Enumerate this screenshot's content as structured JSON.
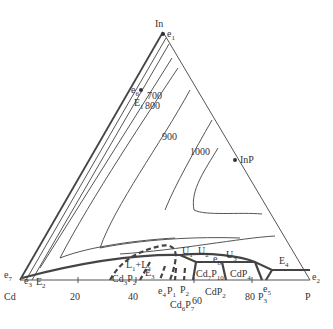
{
  "diagram": {
    "type": "ternary phase diagram (liquidus projection)",
    "vertices": {
      "top": "In",
      "left": "Cd",
      "right": "P"
    },
    "bottom_axis_ticks": [
      "20",
      "40",
      "60",
      "80"
    ],
    "isotherms": [
      "700",
      "800",
      "900",
      "1000"
    ],
    "compounds": [
      "InP",
      "Cd3P2",
      "Cd6P7",
      "Cd7P10",
      "CdP2",
      "CdP4"
    ],
    "invariant_points": [
      "e1",
      "e2",
      "e3",
      "e4",
      "e5",
      "e6",
      "e7",
      "e8",
      "E1",
      "E2",
      "E3",
      "E4",
      "U1",
      "U2",
      "U3"
    ],
    "region_labels": [
      "L1+L2"
    ],
    "phase_markers": [
      "P1",
      "P2",
      "P3"
    ],
    "labels": {
      "In": "In",
      "Cd": "Cd",
      "P": "P",
      "InP": "InP",
      "t20": "20",
      "t40": "40",
      "t60": "60",
      "t80": "80",
      "i700": "700",
      "i800": "800",
      "i900": "900",
      "i1000": "1000",
      "e": "e",
      "E": "E",
      "U": "U",
      "Pp": "P",
      "L": "L",
      "plus": "+",
      "s1": "1",
      "s2": "2",
      "s3": "3",
      "s4": "4",
      "s5": "5",
      "s6": "6",
      "s7": "7",
      "s8": "8",
      "s10": "10"
    }
  }
}
